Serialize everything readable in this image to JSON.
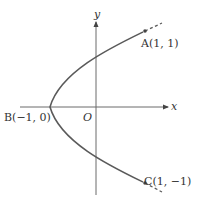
{
  "diagram": {
    "type": "parabola-plot",
    "equation_implied": "x = 2y^2 - 1",
    "axes": {
      "x_label": "x",
      "y_label": "y",
      "origin_label": "O"
    },
    "points": [
      {
        "id": "A",
        "label": "A(1, 1)",
        "x": 1,
        "y": 1
      },
      {
        "id": "B",
        "label": "B(−1, 0)",
        "x": -1,
        "y": 0
      },
      {
        "id": "C",
        "label": "C(1, −1)",
        "x": 1,
        "y": -1
      }
    ],
    "colors": {
      "curve": "#5a5a5a",
      "axis": "#6a6a6a",
      "text": "#333333",
      "background": "#ffffff"
    }
  }
}
